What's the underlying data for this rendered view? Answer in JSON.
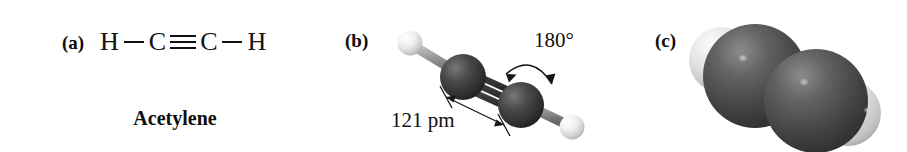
{
  "figure": {
    "background_color": "#ffffff",
    "ink_color": "#111111"
  },
  "panels": {
    "a": {
      "label": "(a)",
      "representation": "lewis-structure",
      "formula_atoms": [
        "H",
        "C",
        "C",
        "H"
      ],
      "bonds": [
        "single",
        "triple",
        "single"
      ],
      "formula_text": "H—C≡C—H",
      "compound_name": "Acetylene"
    },
    "b": {
      "label": "(b)",
      "representation": "ball-and-stick-model",
      "bond_length_annotation": "121 pm",
      "bond_angle_annotation": "180°",
      "carbon_color": "#3c3c3c",
      "hydrogen_color": "#e8e8e8",
      "bond_color": "#8a8a8a"
    },
    "c": {
      "label": "(c)",
      "representation": "space-filling-model",
      "carbon_color": "#4f4f4f",
      "hydrogen_color": "#d8d8d8"
    }
  }
}
